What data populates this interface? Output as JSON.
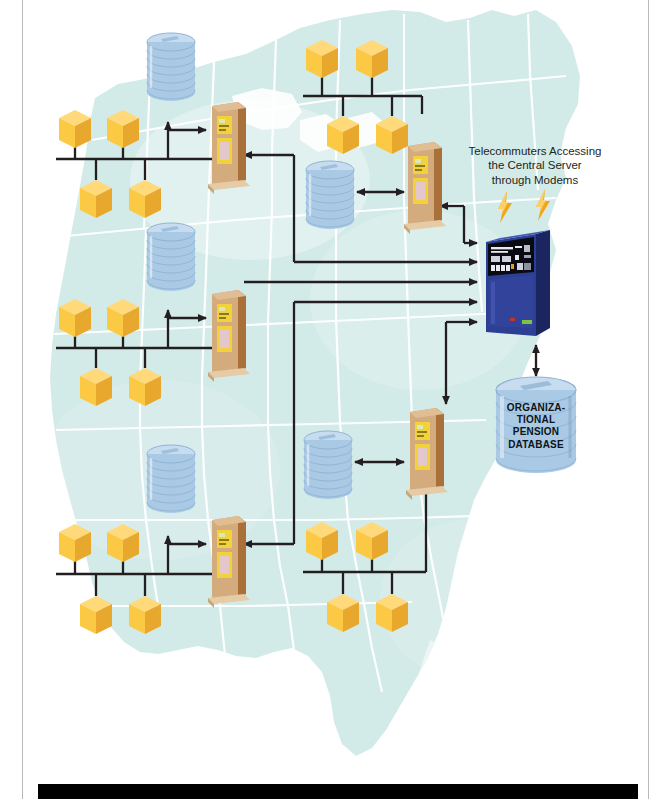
{
  "figure": {
    "kind": "network-topology-diagram",
    "background_map": "united-states-map",
    "map_fill": "#d3ebe8",
    "map_border": "#ffffff"
  },
  "colors": {
    "map": "#d3ebe8",
    "cube_top": "#ffd97a",
    "cube_front": "#fcc944",
    "cube_side": "#e8a82e",
    "tower_front": "#d3ab7c",
    "tower_side": "#a9703a",
    "tower_panel": "#f2d23a",
    "disk_blue": "#a9c9e4",
    "mainframe_blue": "#2d3f94",
    "mainframe_panel": "#0a0a12",
    "wire": "#231f20",
    "bolt": "#f3a51a",
    "page_rule": "#b9b9b9",
    "bottom_bar": "#000000"
  },
  "labels": {
    "telecommuters": "Telecommuters Accessing the Central Server through Modems",
    "telecommuters_lines": [
      "Telecommuters Accessing",
      "the Central Server",
      "through Modems"
    ],
    "central_database": "ORGANIZATIONAL PENSION DATABASE",
    "central_database_lines": [
      "ORGANIZA-",
      "TIONAL",
      "PENSION",
      "DATABASE"
    ]
  },
  "nodes": {
    "central_server": {
      "name": "central-server",
      "type": "mainframe"
    },
    "central_database": {
      "name": "organizational-pension-database",
      "type": "database-cylinder"
    },
    "lightning_bolts": [
      {
        "name": "modem-signal-left"
      },
      {
        "name": "modem-signal-right"
      }
    ],
    "site_servers": [
      {
        "name": "site-server-northwest",
        "type": "tower"
      },
      {
        "name": "site-server-north-central",
        "type": "tower"
      },
      {
        "name": "site-server-midwest",
        "type": "tower"
      },
      {
        "name": "site-server-southwest",
        "type": "tower"
      },
      {
        "name": "site-server-southeast",
        "type": "tower"
      }
    ],
    "local_databases": [
      {
        "name": "local-database-northwest",
        "type": "disk-stack"
      },
      {
        "name": "local-database-north-central",
        "type": "disk-stack"
      },
      {
        "name": "local-database-midwest",
        "type": "disk-stack"
      },
      {
        "name": "local-database-southwest",
        "type": "disk-stack"
      },
      {
        "name": "local-database-southeast",
        "type": "disk-stack"
      }
    ],
    "client_clusters": [
      {
        "name": "client-cluster-northwest",
        "workstations": 4
      },
      {
        "name": "client-cluster-north-central",
        "workstations": 4
      },
      {
        "name": "client-cluster-midwest",
        "workstations": 4
      },
      {
        "name": "client-cluster-southwest",
        "workstations": 4
      },
      {
        "name": "client-cluster-southeast",
        "workstations": 4
      }
    ]
  },
  "connections": {
    "arrows_into_central_server": 5,
    "bidirectional_links": [
      "local-database-north-central <-> site-server-north-central",
      "local-database-southeast <-> site-server-southeast",
      "central-server <-> organizational-pension-database"
    ]
  }
}
